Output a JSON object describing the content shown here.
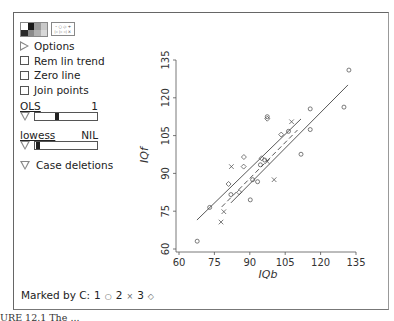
{
  "toolbar": {
    "palette_colors": [
      "#ffffff",
      "#1a1a1a",
      "#9a9a9a",
      "#c8c8c8",
      "#2a2a2a",
      "#8a8a8a",
      "#b0b0b0",
      "#d8d8d8"
    ],
    "marker_glyphs_line1": "◦ ○ ◇ +",
    "marker_glyphs_line2": "▷ ▷ ◁ ×"
  },
  "panel": {
    "options_label": "Options",
    "checkboxes": [
      {
        "label": "Rem lin trend",
        "checked": false
      },
      {
        "label": "Zero line",
        "checked": false
      },
      {
        "label": "Join points",
        "checked": false
      }
    ],
    "ols_slider": {
      "label": "OLS",
      "value": "1",
      "thumb_pct": 33
    },
    "lowess_slider": {
      "label": "lowess",
      "value": "NIL",
      "thumb_pct": 2
    },
    "case_deletions_label": "Case deletions"
  },
  "legend": {
    "prefix": "Marked by C:",
    "groups": [
      {
        "value": "1",
        "marker": "○"
      },
      {
        "value": "2",
        "marker": "×"
      },
      {
        "value": "3",
        "marker": "◇"
      }
    ]
  },
  "caption": "URE 12.1   The ...",
  "chart_data": {
    "type": "scatter",
    "title": "",
    "xlabel": "IQb",
    "ylabel": "IQf",
    "xlim": [
      60,
      135
    ],
    "ylim": [
      60,
      135
    ],
    "xticks": [
      60,
      75,
      90,
      105,
      120,
      135
    ],
    "yticks": [
      60,
      75,
      90,
      105,
      120,
      135
    ],
    "grid": false,
    "legend": "Marked by C: 1 circle, 2 cross, 3 diamond (bottom-left)",
    "series": [
      {
        "name": "C=1",
        "marker": "circle",
        "points": [
          [
            67.7,
            63.1
          ],
          [
            73.0,
            76.5
          ],
          [
            82.0,
            81.6
          ],
          [
            90.2,
            79.5
          ],
          [
            91.2,
            87.5
          ],
          [
            93.3,
            86.7
          ],
          [
            94.5,
            93.4
          ],
          [
            96.3,
            95.3
          ],
          [
            97.4,
            112.5
          ],
          [
            106.4,
            106.7
          ],
          [
            111.7,
            97.6
          ],
          [
            115.6,
            115.6
          ],
          [
            115.6,
            107.4
          ],
          [
            129.9,
            116.3
          ],
          [
            132.0,
            131.0
          ]
        ]
      },
      {
        "name": "C=2",
        "marker": "cross",
        "points": [
          [
            77.8,
            70.7
          ],
          [
            79.0,
            74.8
          ],
          [
            82.2,
            92.7
          ],
          [
            97.4,
            94.7
          ],
          [
            100.3,
            87.5
          ],
          [
            107.7,
            110.5
          ]
        ]
      },
      {
        "name": "C=3",
        "marker": "diamond",
        "points": [
          [
            81.0,
            85.8
          ],
          [
            85.5,
            82.5
          ],
          [
            87.4,
            92.7
          ],
          [
            87.5,
            96.5
          ],
          [
            95.0,
            96.0
          ],
          [
            97.4,
            111.7
          ],
          [
            103.3,
            105.4
          ]
        ]
      }
    ],
    "lines": [
      {
        "name": "fit-group-3",
        "style": "solid",
        "from": [
          67.6,
          71.5
        ],
        "to": [
          111.7,
          111.6
        ]
      },
      {
        "name": "fit-group-2",
        "style": "dashed",
        "from": [
          78.1,
          76.7
        ],
        "to": [
          110.2,
          107.2
        ]
      },
      {
        "name": "fit-group-1",
        "style": "solid",
        "from": [
          82.0,
          78.3
        ],
        "to": [
          131.6,
          125.1
        ]
      }
    ]
  }
}
